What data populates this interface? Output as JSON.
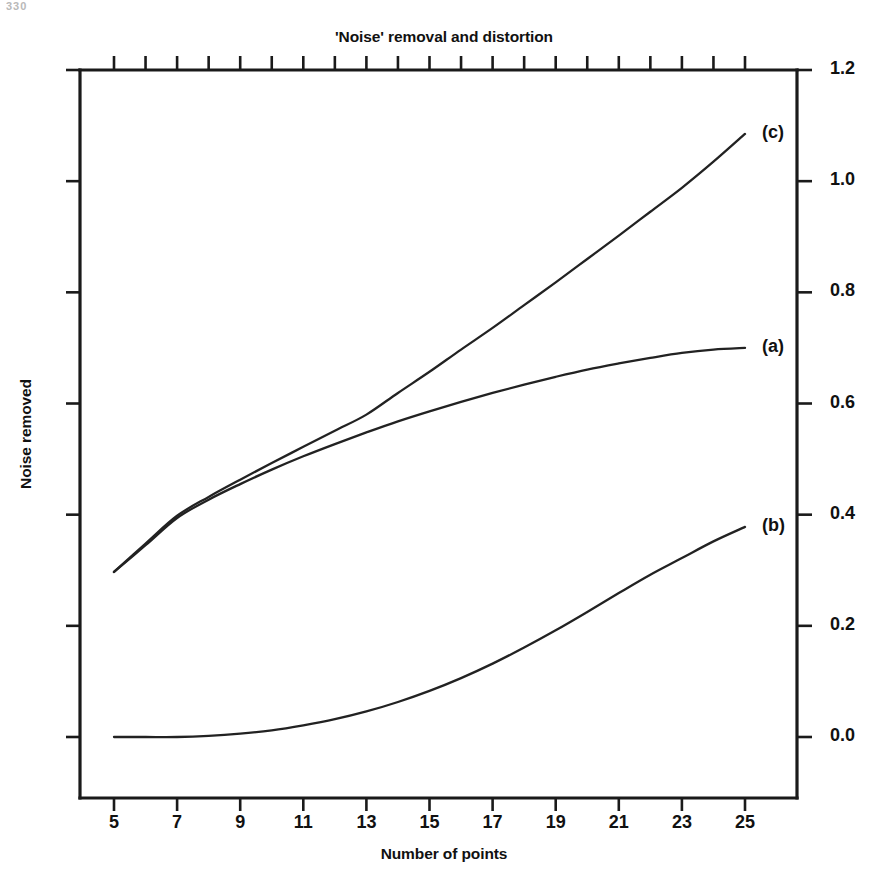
{
  "page": {
    "scan_artifact_text": "330",
    "background": "#ffffff",
    "ink_color": "#1a1a1a"
  },
  "chart_data": {
    "type": "line",
    "title": "'Noise' removal and distortion",
    "xlabel": "Number of points",
    "ylabel": "Noise removed",
    "xlim": [
      4,
      26
    ],
    "ylim": [
      -0.11,
      1.2
    ],
    "xticks": [
      5,
      7,
      9,
      11,
      13,
      15,
      17,
      19,
      21,
      23,
      25
    ],
    "xtick_labels": [
      "5",
      "7",
      "9",
      "11",
      "13",
      "15",
      "17",
      "19",
      "21",
      "23",
      "25"
    ],
    "xticks_minor": [
      6,
      8,
      10,
      12,
      14,
      16,
      18,
      20,
      22,
      24
    ],
    "yticks": [
      0.0,
      0.2,
      0.4,
      0.6,
      0.8,
      1.0,
      1.2
    ],
    "ytick_labels": [
      "0.0",
      "0.2",
      "0.4",
      "0.6",
      "0.8",
      "1.0",
      "1.2"
    ],
    "yaxis_position": "right",
    "grid": false,
    "legend": "inline-curve-labels",
    "x": [
      5,
      6,
      7,
      8,
      9,
      10,
      11,
      12,
      13,
      14,
      15,
      16,
      17,
      18,
      19,
      20,
      21,
      22,
      23,
      24,
      25
    ],
    "series": [
      {
        "name": "(a)",
        "label": "(a)",
        "label_x": 25,
        "label_y": 0.7,
        "values": [
          0.297,
          0.345,
          0.394,
          0.427,
          0.455,
          0.481,
          0.505,
          0.527,
          0.548,
          0.568,
          0.586,
          0.603,
          0.619,
          0.634,
          0.648,
          0.661,
          0.672,
          0.682,
          0.691,
          0.697,
          0.7
        ]
      },
      {
        "name": "(b)",
        "label": "(b)",
        "label_x": 25,
        "label_y": 0.378,
        "values": [
          0.0,
          0.0,
          0.0,
          0.002,
          0.006,
          0.012,
          0.021,
          0.032,
          0.046,
          0.063,
          0.083,
          0.106,
          0.132,
          0.161,
          0.192,
          0.225,
          0.259,
          0.292,
          0.322,
          0.352,
          0.378
        ]
      },
      {
        "name": "(c)",
        "label": "(c)",
        "label_x": 25,
        "label_y": 1.085,
        "values": [
          0.297,
          0.348,
          0.398,
          0.432,
          0.463,
          0.493,
          0.522,
          0.551,
          0.58,
          0.619,
          0.657,
          0.697,
          0.736,
          0.777,
          0.818,
          0.86,
          0.902,
          0.945,
          0.988,
          1.035,
          1.085
        ]
      }
    ]
  }
}
